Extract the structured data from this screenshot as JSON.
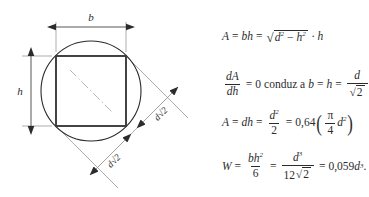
{
  "figure": {
    "kind": "engineering-diagram",
    "labels": {
      "width": "b",
      "height": "h",
      "diagonal_lower": "d√2",
      "diagonal_upper": "d√2"
    },
    "colors": {
      "outline": "#2b2b2b",
      "thin_line": "#8a8a8a",
      "centerline": "#9a9a9a",
      "background": "#ffffff"
    }
  },
  "formulas": {
    "eq1": {
      "lhs": "A",
      "eq1": "=",
      "bh": "bh",
      "eq2": "=",
      "radicand_d": "d",
      "radicand_d_pow": "2",
      "minus": "−",
      "radicand_h": "h",
      "radicand_h_pow": "2",
      "dot": "·",
      "tail": "h",
      "plain": "A = bh = √(d² − h²) · h"
    },
    "eq2": {
      "frac_num": "dA",
      "frac_den": "dh",
      "eq": "=",
      "zero": "0",
      "text": "conduz a",
      "b": "b",
      "eq_b": "=",
      "h": "h",
      "eq_h": "=",
      "res_num": "d",
      "res_den_sqrt": "√",
      "res_den": "2",
      "plain": "dA/dh = 0 conduz a b = h = d/√2"
    },
    "eq3": {
      "lhs": "A",
      "eq1": "=",
      "dh": "dh",
      "eq2": "=",
      "frac_num": "d",
      "frac_num_pow": "2",
      "frac_den": "2",
      "eq3": "=",
      "coef": "0,64",
      "paren_num": "π",
      "paren_den": "4",
      "paren_var": "d",
      "paren_var_pow": "2",
      "plain": "A = dh = d²/2 = 0,64(π/4 d²)"
    },
    "eq4": {
      "lhs": "W",
      "eq1": "=",
      "f1_num": "bh",
      "f1_num_pow": "2",
      "f1_den": "6",
      "eq2": "=",
      "f2_num": "d",
      "f2_num_pow": "3",
      "f2_den": "12",
      "f2_den_sqrt": "√",
      "f2_den_root": "2",
      "eq3": "=",
      "result": "0,059",
      "result_var": "d",
      "result_pow": "3",
      "period": ".",
      "plain": "W = bh²/6 = d³/(12√2) = 0,059d³."
    }
  }
}
